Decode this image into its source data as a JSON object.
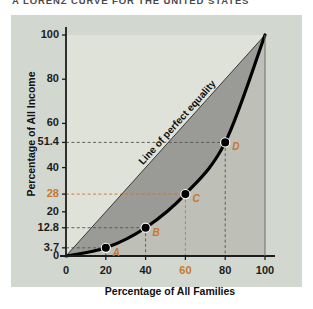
{
  "title": "A LORENZ CURVE FOR THE UNITED STATES",
  "colors": {
    "plate_bg": "#d2d8d0",
    "plot_bg": "#dfe2d8",
    "gap_fill": "#9a9a96",
    "lower_fill": "#b8bab2",
    "curve": "#000000",
    "accent": "#c8772c",
    "axis": "#1c1c1c",
    "guide": "#55554f"
  },
  "annotations": {
    "equality_line": "Line of perfect equality"
  },
  "chart_data": {
    "type": "line",
    "title": "A LORENZ CURVE FOR THE UNITED STATES",
    "xlabel": "Percentage of All Families",
    "ylabel": "Percentage of All Income",
    "xlim": [
      0,
      100
    ],
    "ylim": [
      0,
      100
    ],
    "grid": false,
    "legend_position": "inline-diagonal",
    "x_ticks": [
      {
        "value": 0,
        "label": "0",
        "highlight": false
      },
      {
        "value": 20,
        "label": "20",
        "highlight": false
      },
      {
        "value": 40,
        "label": "40",
        "highlight": false
      },
      {
        "value": 60,
        "label": "60",
        "highlight": true
      },
      {
        "value": 80,
        "label": "80",
        "highlight": false
      },
      {
        "value": 100,
        "label": "100",
        "highlight": false
      }
    ],
    "y_ticks": [
      {
        "value": 0,
        "label": "0",
        "highlight": false
      },
      {
        "value": 3.7,
        "label": "3.7",
        "highlight": false
      },
      {
        "value": 12.8,
        "label": "12.8",
        "highlight": false
      },
      {
        "value": 20,
        "label": "20",
        "highlight": false
      },
      {
        "value": 28,
        "label": "28",
        "highlight": true
      },
      {
        "value": 40,
        "label": "40",
        "highlight": false
      },
      {
        "value": 51.4,
        "label": "51.4",
        "highlight": false
      },
      {
        "value": 60,
        "label": "60",
        "highlight": false
      },
      {
        "value": 80,
        "label": "80",
        "highlight": false
      },
      {
        "value": 100,
        "label": "100",
        "highlight": false
      }
    ],
    "series": [
      {
        "name": "Line of perfect equality",
        "type": "line",
        "x": [
          0,
          100
        ],
        "values": [
          0,
          100
        ]
      },
      {
        "name": "Lorenz curve",
        "type": "line",
        "x": [
          0,
          20,
          40,
          60,
          80,
          100
        ],
        "values": [
          0,
          3.7,
          12.8,
          28,
          51.4,
          100
        ]
      }
    ],
    "points": [
      {
        "label": "A",
        "x": 20,
        "y": 3.7
      },
      {
        "label": "B",
        "x": 40,
        "y": 12.8
      },
      {
        "label": "C",
        "x": 60,
        "y": 28
      },
      {
        "label": "D",
        "x": 80,
        "y": 51.4
      }
    ]
  }
}
